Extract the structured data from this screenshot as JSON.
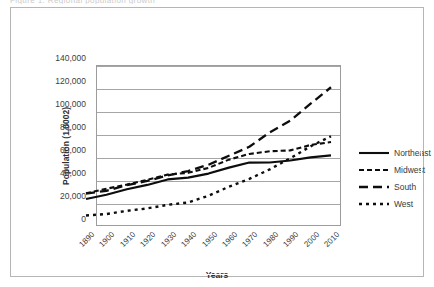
{
  "figure": {
    "caption_fragment": "Figure 1. Regional population growth",
    "frame_color": "#b5b5b5",
    "grid_color": "#a6a6a6",
    "series_color": "#0d0d0d"
  },
  "axes": {
    "ylabel": "Population (1,0002)",
    "xlabel": "Years",
    "yticks": [
      "0",
      "20,000",
      "40,000",
      "60,000",
      "80,000",
      "100,000",
      "120,000",
      "140,000"
    ],
    "xticks": [
      "1890",
      "1900",
      "1910",
      "1920",
      "1930",
      "1940",
      "1950",
      "1960",
      "1970",
      "1980",
      "1990",
      "2000",
      "2010"
    ]
  },
  "legend": {
    "items": [
      {
        "label": "Northeast",
        "key": "solid-line-key"
      },
      {
        "label": "Midwest",
        "key": "short-dash-line-key"
      },
      {
        "label": "South",
        "key": "long-dash-line-key"
      },
      {
        "label": "West",
        "key": "dotted-line-key"
      }
    ]
  },
  "chart_data": {
    "type": "line",
    "title": "",
    "xlabel": "Years",
    "ylabel": "Population (1,0002)",
    "x": [
      1890,
      1900,
      1910,
      1920,
      1930,
      1940,
      1950,
      1960,
      1970,
      1980,
      1990,
      2000,
      2010
    ],
    "xlim": [
      1890,
      2010
    ],
    "ylim": [
      0,
      140000
    ],
    "ytick_step": 20000,
    "grid": "horizontal",
    "legend_position": "right",
    "series": [
      {
        "name": "Northeast",
        "style": "solid",
        "values": [
          17407,
          21047,
          25869,
          29662,
          34427,
          35977,
          39478,
          44678,
          49041,
          49135,
          50809,
          53594,
          55318
        ]
      },
      {
        "name": "Midwest",
        "style": "short-dash",
        "values": [
          22410,
          26333,
          29889,
          34020,
          38594,
          40143,
          44461,
          51619,
          56590,
          58866,
          59669,
          64393,
          66927
        ]
      },
      {
        "name": "South",
        "style": "long-dash",
        "values": [
          22036,
          24524,
          29389,
          33126,
          37858,
          41666,
          47197,
          54973,
          62813,
          75372,
          85446,
          100237,
          114556
        ]
      },
      {
        "name": "West",
        "style": "dotted",
        "values": [
          3102,
          4309,
          7082,
          9214,
          12324,
          14379,
          20190,
          28053,
          34838,
          43172,
          52786,
          63198,
          71945
        ]
      }
    ]
  }
}
